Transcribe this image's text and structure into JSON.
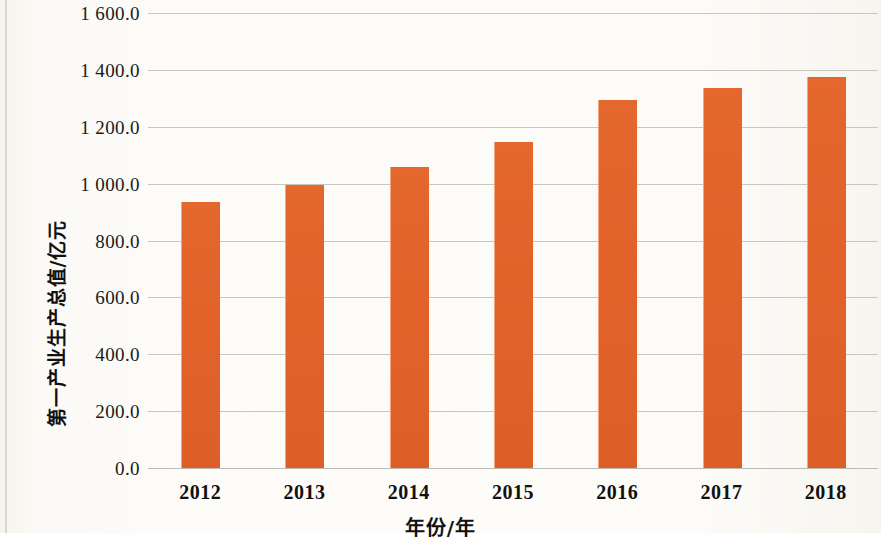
{
  "chart_data": {
    "type": "bar",
    "title": "",
    "categories": [
      "2012",
      "2013",
      "2014",
      "2015",
      "2016",
      "2017",
      "2018"
    ],
    "values": [
      935,
      995,
      1060,
      1145,
      1295,
      1335,
      1375
    ],
    "series": [
      {
        "name": "第一产业生产总值",
        "values": [
          935,
          995,
          1060,
          1145,
          1295,
          1335,
          1375
        ]
      }
    ],
    "xlabel": "年份/年",
    "ylabel": "第一产业生产总值/亿元",
    "ylim": [
      0,
      1600
    ],
    "yticks": [
      0,
      200,
      400,
      600,
      800,
      1000,
      1200,
      1400,
      1600
    ],
    "ytick_labels": [
      "0.0",
      "200.0",
      "400.0",
      "600.0",
      "800.0",
      "1 000.0",
      "1 200.0",
      "1 400.0",
      "1 600.0"
    ],
    "xtick_labels": [
      "2012",
      "2013",
      "2014",
      "2015",
      "2016",
      "2017",
      "2018"
    ],
    "grid": true,
    "grid_axis": "y",
    "legend": false,
    "legend_position": "none",
    "bar_color": "#E2622A",
    "grid_color": "#C9C6BE",
    "background_color": "#FAF8F3",
    "text_color": "#111111"
  },
  "axes": {
    "y": {
      "ticks": [
        {
          "value": 1600,
          "label": "1 600.0"
        },
        {
          "value": 1400,
          "label": "1 400.0"
        },
        {
          "value": 1200,
          "label": "1 200.0"
        },
        {
          "value": 1000,
          "label": "1 000.0"
        },
        {
          "value": 800,
          "label": "800.0"
        },
        {
          "value": 600,
          "label": "600.0"
        },
        {
          "value": 400,
          "label": "400.0"
        },
        {
          "value": 200,
          "label": "200.0"
        },
        {
          "value": 0,
          "label": "0.0"
        }
      ],
      "title": "第一产业生产总值/亿元"
    },
    "x": {
      "ticks": [
        {
          "label": "2012"
        },
        {
          "label": "2013"
        },
        {
          "label": "2014"
        },
        {
          "label": "2015"
        },
        {
          "label": "2016"
        },
        {
          "label": "2017"
        },
        {
          "label": "2018"
        }
      ],
      "title": "年份/年"
    }
  }
}
